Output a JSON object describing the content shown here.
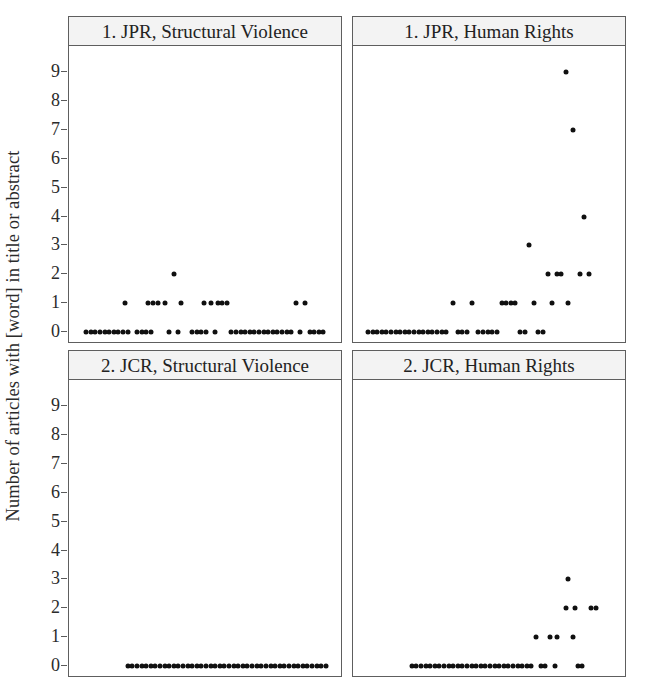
{
  "figure": {
    "y_axis_label": "Number of articles with [word] in title or abstract",
    "y_ticks": [
      "9",
      "8",
      "7",
      "6",
      "5",
      "4",
      "3",
      "2",
      "1",
      "0"
    ],
    "dot_color": "#101010",
    "strip_color": "#f3f3f3",
    "border_color": "#5e5e5e",
    "panels": [
      {
        "title": "1. JPR, Structural Violence"
      },
      {
        "title": "1. JPR, Human Rights"
      },
      {
        "title": "2. JCR, Structural Violence"
      },
      {
        "title": "2. JCR, Human Rights"
      }
    ]
  },
  "chart_data": {
    "type": "scatter",
    "title": "",
    "xlabel": "",
    "ylabel": "Number of articles with [word] in title or abstract",
    "ylim": [
      0,
      9.6
    ],
    "yticks": [
      0,
      1,
      2,
      3,
      4,
      5,
      6,
      7,
      8,
      9
    ],
    "xlim": [
      0,
      100
    ],
    "grid": false,
    "legend": null,
    "layout": "2x2 trellis",
    "panels": [
      {
        "name": "1. JPR, Structural Violence",
        "row": 0,
        "col": 0,
        "points": [
          {
            "x": 4,
            "y": 0
          },
          {
            "x": 6,
            "y": 0
          },
          {
            "x": 8,
            "y": 0
          },
          {
            "x": 10,
            "y": 0
          },
          {
            "x": 12,
            "y": 0
          },
          {
            "x": 14,
            "y": 0
          },
          {
            "x": 16,
            "y": 0
          },
          {
            "x": 18,
            "y": 0
          },
          {
            "x": 20,
            "y": 0
          },
          {
            "x": 22,
            "y": 0
          },
          {
            "x": 26,
            "y": 0
          },
          {
            "x": 28,
            "y": 0
          },
          {
            "x": 30,
            "y": 0
          },
          {
            "x": 32,
            "y": 0
          },
          {
            "x": 40,
            "y": 0
          },
          {
            "x": 44,
            "y": 0
          },
          {
            "x": 50,
            "y": 0
          },
          {
            "x": 52,
            "y": 0
          },
          {
            "x": 54,
            "y": 0
          },
          {
            "x": 56,
            "y": 0
          },
          {
            "x": 60,
            "y": 0
          },
          {
            "x": 67,
            "y": 0
          },
          {
            "x": 69,
            "y": 0
          },
          {
            "x": 71,
            "y": 0
          },
          {
            "x": 73,
            "y": 0
          },
          {
            "x": 75,
            "y": 0
          },
          {
            "x": 77,
            "y": 0
          },
          {
            "x": 79,
            "y": 0
          },
          {
            "x": 81,
            "y": 0
          },
          {
            "x": 83,
            "y": 0
          },
          {
            "x": 85,
            "y": 0
          },
          {
            "x": 87,
            "y": 0
          },
          {
            "x": 89,
            "y": 0
          },
          {
            "x": 91,
            "y": 0
          },
          {
            "x": 93,
            "y": 0
          },
          {
            "x": 97,
            "y": 0
          },
          {
            "x": 101,
            "y": 0
          },
          {
            "x": 103,
            "y": 0
          },
          {
            "x": 105,
            "y": 0
          },
          {
            "x": 107,
            "y": 0
          },
          {
            "x": 21,
            "y": 1
          },
          {
            "x": 31,
            "y": 1
          },
          {
            "x": 33,
            "y": 1
          },
          {
            "x": 35,
            "y": 1
          },
          {
            "x": 38,
            "y": 1
          },
          {
            "x": 45,
            "y": 1
          },
          {
            "x": 55,
            "y": 1
          },
          {
            "x": 58,
            "y": 1
          },
          {
            "x": 61,
            "y": 1
          },
          {
            "x": 63,
            "y": 1
          },
          {
            "x": 65,
            "y": 1
          },
          {
            "x": 95,
            "y": 1
          },
          {
            "x": 99,
            "y": 1
          },
          {
            "x": 42,
            "y": 2
          }
        ]
      },
      {
        "name": "1. JPR, Human Rights",
        "row": 0,
        "col": 1,
        "points": [
          {
            "x": 3,
            "y": 0
          },
          {
            "x": 5,
            "y": 0
          },
          {
            "x": 7,
            "y": 0
          },
          {
            "x": 9,
            "y": 0
          },
          {
            "x": 11,
            "y": 0
          },
          {
            "x": 13,
            "y": 0
          },
          {
            "x": 15,
            "y": 0
          },
          {
            "x": 17,
            "y": 0
          },
          {
            "x": 19,
            "y": 0
          },
          {
            "x": 21,
            "y": 0
          },
          {
            "x": 23,
            "y": 0
          },
          {
            "x": 25,
            "y": 0
          },
          {
            "x": 27,
            "y": 0
          },
          {
            "x": 29,
            "y": 0
          },
          {
            "x": 31,
            "y": 0
          },
          {
            "x": 33,
            "y": 0
          },
          {
            "x": 35,
            "y": 0
          },
          {
            "x": 37,
            "y": 0
          },
          {
            "x": 42,
            "y": 0
          },
          {
            "x": 44,
            "y": 0
          },
          {
            "x": 46,
            "y": 0
          },
          {
            "x": 51,
            "y": 0
          },
          {
            "x": 53,
            "y": 0
          },
          {
            "x": 55,
            "y": 0
          },
          {
            "x": 57,
            "y": 0
          },
          {
            "x": 59,
            "y": 0
          },
          {
            "x": 69,
            "y": 0
          },
          {
            "x": 71,
            "y": 0
          },
          {
            "x": 77,
            "y": 0
          },
          {
            "x": 79,
            "y": 0
          },
          {
            "x": 40,
            "y": 1
          },
          {
            "x": 48,
            "y": 1
          },
          {
            "x": 61,
            "y": 1
          },
          {
            "x": 63,
            "y": 1
          },
          {
            "x": 65,
            "y": 1
          },
          {
            "x": 67,
            "y": 1
          },
          {
            "x": 75,
            "y": 1
          },
          {
            "x": 83,
            "y": 1
          },
          {
            "x": 90,
            "y": 1
          },
          {
            "x": 81,
            "y": 2
          },
          {
            "x": 85,
            "y": 2
          },
          {
            "x": 87,
            "y": 2
          },
          {
            "x": 95,
            "y": 2
          },
          {
            "x": 99,
            "y": 2
          },
          {
            "x": 73,
            "y": 3
          },
          {
            "x": 97,
            "y": 4
          },
          {
            "x": 92,
            "y": 7
          },
          {
            "x": 89,
            "y": 9
          }
        ]
      },
      {
        "name": "2. JCR, Structural Violence",
        "row": 1,
        "col": 0,
        "points": [
          {
            "x": 22,
            "y": 0
          },
          {
            "x": 24,
            "y": 0
          },
          {
            "x": 26,
            "y": 0
          },
          {
            "x": 28,
            "y": 0
          },
          {
            "x": 30,
            "y": 0
          },
          {
            "x": 32,
            "y": 0
          },
          {
            "x": 34,
            "y": 0
          },
          {
            "x": 36,
            "y": 0
          },
          {
            "x": 38,
            "y": 0
          },
          {
            "x": 40,
            "y": 0
          },
          {
            "x": 42,
            "y": 0
          },
          {
            "x": 44,
            "y": 0
          },
          {
            "x": 46,
            "y": 0
          },
          {
            "x": 48,
            "y": 0
          },
          {
            "x": 50,
            "y": 0
          },
          {
            "x": 52,
            "y": 0
          },
          {
            "x": 54,
            "y": 0
          },
          {
            "x": 56,
            "y": 0
          },
          {
            "x": 58,
            "y": 0
          },
          {
            "x": 60,
            "y": 0
          },
          {
            "x": 62,
            "y": 0
          },
          {
            "x": 64,
            "y": 0
          },
          {
            "x": 66,
            "y": 0
          },
          {
            "x": 68,
            "y": 0
          },
          {
            "x": 70,
            "y": 0
          },
          {
            "x": 72,
            "y": 0
          },
          {
            "x": 74,
            "y": 0
          },
          {
            "x": 76,
            "y": 0
          },
          {
            "x": 78,
            "y": 0
          },
          {
            "x": 80,
            "y": 0
          },
          {
            "x": 82,
            "y": 0
          },
          {
            "x": 84,
            "y": 0
          },
          {
            "x": 86,
            "y": 0
          },
          {
            "x": 88,
            "y": 0
          },
          {
            "x": 90,
            "y": 0
          },
          {
            "x": 92,
            "y": 0
          },
          {
            "x": 94,
            "y": 0
          },
          {
            "x": 96,
            "y": 0
          },
          {
            "x": 98,
            "y": 0
          },
          {
            "x": 100,
            "y": 0
          },
          {
            "x": 102,
            "y": 0
          },
          {
            "x": 104,
            "y": 0
          },
          {
            "x": 106,
            "y": 0
          },
          {
            "x": 108,
            "y": 0
          }
        ]
      },
      {
        "name": "2. JCR, Human Rights",
        "row": 1,
        "col": 1,
        "points": [
          {
            "x": 22,
            "y": 0
          },
          {
            "x": 24,
            "y": 0
          },
          {
            "x": 26,
            "y": 0
          },
          {
            "x": 28,
            "y": 0
          },
          {
            "x": 30,
            "y": 0
          },
          {
            "x": 32,
            "y": 0
          },
          {
            "x": 34,
            "y": 0
          },
          {
            "x": 36,
            "y": 0
          },
          {
            "x": 38,
            "y": 0
          },
          {
            "x": 40,
            "y": 0
          },
          {
            "x": 42,
            "y": 0
          },
          {
            "x": 44,
            "y": 0
          },
          {
            "x": 46,
            "y": 0
          },
          {
            "x": 48,
            "y": 0
          },
          {
            "x": 50,
            "y": 0
          },
          {
            "x": 52,
            "y": 0
          },
          {
            "x": 54,
            "y": 0
          },
          {
            "x": 56,
            "y": 0
          },
          {
            "x": 58,
            "y": 0
          },
          {
            "x": 60,
            "y": 0
          },
          {
            "x": 62,
            "y": 0
          },
          {
            "x": 64,
            "y": 0
          },
          {
            "x": 66,
            "y": 0
          },
          {
            "x": 68,
            "y": 0
          },
          {
            "x": 70,
            "y": 0
          },
          {
            "x": 72,
            "y": 0
          },
          {
            "x": 74,
            "y": 0
          },
          {
            "x": 78,
            "y": 0
          },
          {
            "x": 80,
            "y": 0
          },
          {
            "x": 84,
            "y": 0
          },
          {
            "x": 94,
            "y": 0
          },
          {
            "x": 96,
            "y": 0
          },
          {
            "x": 76,
            "y": 1
          },
          {
            "x": 82,
            "y": 1
          },
          {
            "x": 85,
            "y": 1
          },
          {
            "x": 92,
            "y": 1
          },
          {
            "x": 89,
            "y": 2
          },
          {
            "x": 93,
            "y": 2
          },
          {
            "x": 100,
            "y": 2
          },
          {
            "x": 102,
            "y": 2
          },
          {
            "x": 90,
            "y": 3
          }
        ]
      }
    ]
  }
}
